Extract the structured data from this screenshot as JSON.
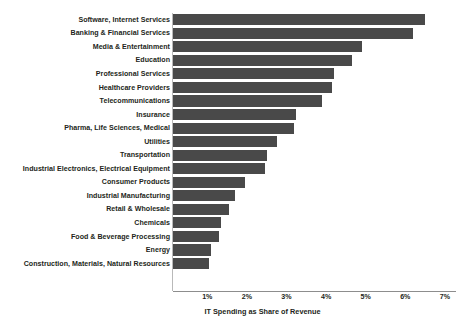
{
  "chart_data": {
    "type": "bar",
    "orientation": "horizontal",
    "title": "",
    "subtitle": "",
    "xlabel": "IT Spending as Share of Revenue",
    "ylabel": "",
    "xlim": [
      0,
      7.2
    ],
    "xticks": [
      1,
      2,
      3,
      4,
      5,
      6,
      7
    ],
    "xtick_labels": [
      "1%",
      "2%",
      "3%",
      "4%",
      "5%",
      "6%",
      "7%"
    ],
    "grid": false,
    "legend": null,
    "bar_color": "#494949",
    "text_color": "#231f20",
    "axis_color": "#8d8d8d",
    "background": "#ffffff",
    "categories": [
      "Software, Internet Services",
      "Banking & Financial Services",
      "Media & Entertainment",
      "Education",
      "Professional Services",
      "Healthcare Providers",
      "Telecommunications",
      "Insurance",
      "Pharma, Life Sciences, Medical",
      "Utilities",
      "Transportation",
      "Industrial Electronics, Electrical Equipment",
      "Consumer Products",
      "Industrial Manufacturing",
      "Retail & Wholesale",
      "Chemicals",
      "Food & Beverage Processing",
      "Energy",
      "Construction, Materials, Natural Resources"
    ],
    "values": [
      6.5,
      6.2,
      4.9,
      4.65,
      4.2,
      4.15,
      3.9,
      3.25,
      3.2,
      2.75,
      2.5,
      2.45,
      1.95,
      1.7,
      1.55,
      1.35,
      1.3,
      1.1,
      1.05
    ]
  }
}
